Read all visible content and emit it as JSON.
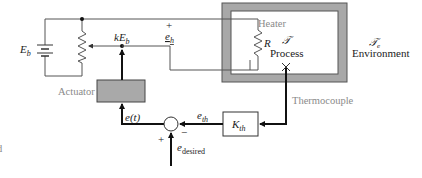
{
  "diagram": {
    "labels": {
      "battery": "E",
      "battery_sub": "b",
      "wiper_voltage_k": "kE",
      "wiper_voltage_sub": "b",
      "heater_voltage": "e",
      "heater_voltage_sub": "h",
      "heater_plus": "+",
      "heater_minus": "−",
      "heater": "Heater",
      "resistor": "R",
      "process_symbol": "𝒯",
      "process": "Process",
      "environment_symbol": "𝒯",
      "environment_sub": "e",
      "environment": "Environment",
      "actuator": "Actuator",
      "thermocouple": "Thermocouple",
      "error_signal": "e(t)",
      "thermo_signal": "e",
      "thermo_signal_sub": "th",
      "gain_block": "K",
      "gain_block_sub": "th",
      "desired_signal": "e",
      "desired_signal_sub": "desired",
      "sum_plus": "+",
      "sum_minus": "−",
      "edge_fragment": "d"
    },
    "colors": {
      "wire": "#555555",
      "signal": "#111111",
      "frame_grey": "#a8a8a8",
      "actuator_fill": "#a9a9a9",
      "grey_text": "#8a8a8a"
    }
  }
}
